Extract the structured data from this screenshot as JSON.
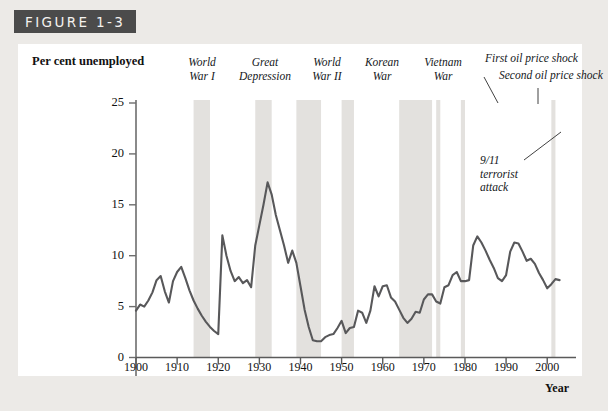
{
  "figure": {
    "banner_label": "FIGURE 1-3"
  },
  "chart_data": {
    "type": "line",
    "title": "",
    "xlabel": "Year",
    "ylabel": "Per cent unemployed",
    "xlim": [
      1900,
      2007
    ],
    "ylim": [
      0,
      27
    ],
    "yticks": [
      "0",
      "5",
      "10",
      "15",
      "20",
      "25"
    ],
    "ytick_values": [
      0,
      5,
      10,
      15,
      20,
      25
    ],
    "xticks": [
      "1900",
      "1910",
      "1920",
      "1930",
      "1940",
      "1950",
      "1960",
      "1970",
      "1980",
      "1990",
      "2000"
    ],
    "xtick_values": [
      1900,
      1910,
      1920,
      1930,
      1940,
      1950,
      1960,
      1970,
      1980,
      1990,
      2000
    ],
    "grid": false,
    "legend": "none",
    "series_name": "Per cent unemployed",
    "line_color": "#58585a",
    "band_color": "#e3e1de",
    "x": [
      1900,
      1901,
      1902,
      1903,
      1904,
      1905,
      1906,
      1907,
      1908,
      1909,
      1910,
      1911,
      1912,
      1913,
      1914,
      1915,
      1916,
      1917,
      1918,
      1919,
      1920,
      1921,
      1922,
      1923,
      1924,
      1925,
      1926,
      1927,
      1928,
      1929,
      1930,
      1931,
      1932,
      1933,
      1934,
      1935,
      1936,
      1937,
      1938,
      1939,
      1940,
      1941,
      1942,
      1943,
      1944,
      1945,
      1946,
      1947,
      1948,
      1949,
      1950,
      1951,
      1952,
      1953,
      1954,
      1955,
      1956,
      1957,
      1958,
      1959,
      1960,
      1961,
      1962,
      1963,
      1964,
      1965,
      1966,
      1967,
      1968,
      1969,
      1970,
      1971,
      1972,
      1973,
      1974,
      1975,
      1976,
      1977,
      1978,
      1979,
      1980,
      1981,
      1982,
      1983,
      1984,
      1985,
      1986,
      1987,
      1988,
      1989,
      1990,
      1991,
      1992,
      1993,
      1994,
      1995,
      1996,
      1997,
      1998,
      1999,
      2000,
      2001,
      2002,
      2003
    ],
    "y": [
      4.6,
      5.2,
      5.0,
      5.6,
      6.4,
      7.6,
      8.0,
      6.5,
      5.4,
      7.5,
      8.4,
      8.9,
      7.8,
      6.6,
      5.6,
      4.8,
      4.1,
      3.5,
      3.0,
      2.6,
      2.3,
      12.0,
      10.0,
      8.5,
      7.5,
      7.9,
      7.3,
      7.6,
      6.9,
      11.0,
      13.0,
      15.0,
      17.2,
      16.0,
      14.0,
      12.5,
      11.0,
      9.3,
      10.5,
      9.3,
      7.0,
      4.7,
      3.0,
      1.7,
      1.6,
      1.6,
      2.0,
      2.2,
      2.3,
      2.9,
      3.6,
      2.4,
      2.9,
      3.0,
      4.6,
      4.4,
      3.4,
      4.6,
      7.0,
      6.0,
      7.0,
      7.1,
      5.9,
      5.5,
      4.7,
      3.9,
      3.4,
      3.8,
      4.5,
      4.4,
      5.7,
      6.2,
      6.2,
      5.5,
      5.3,
      6.9,
      7.1,
      8.1,
      8.4,
      7.5,
      7.5,
      7.6,
      11.0,
      11.9,
      11.3,
      10.5,
      9.6,
      8.8,
      7.8,
      7.5,
      8.1,
      10.4,
      11.3,
      11.2,
      10.4,
      9.5,
      9.7,
      9.2,
      8.3,
      7.6,
      6.8,
      7.2,
      7.7,
      7.6
    ],
    "event_bands": [
      {
        "label": "World\nWar I",
        "start": 1914,
        "end": 1918
      },
      {
        "label": "Great\nDepression",
        "start": 1929,
        "end": 1933
      },
      {
        "label": "World\nWar II",
        "start": 1939,
        "end": 1945
      },
      {
        "label": "Korean\nWar",
        "start": 1950,
        "end": 1953
      },
      {
        "label": "Vietnam\nWar",
        "start": 1964,
        "end": 1972
      },
      {
        "label": "First oil price shock",
        "start": 1973,
        "end": 1974
      },
      {
        "label": "Second oil price shock",
        "start": 1979,
        "end": 1980
      },
      {
        "label": "9/11\nterrorist\nattack",
        "start": 2001,
        "end": 2002
      }
    ],
    "annotations": [
      {
        "text": "World\nWar I"
      },
      {
        "text": "Great\nDepression"
      },
      {
        "text": "World\nWar II"
      },
      {
        "text": "Korean\nWar"
      },
      {
        "text": "Vietnam\nWar"
      },
      {
        "text": "First oil price shock"
      },
      {
        "text": "Second oil price shock"
      },
      {
        "text": "9/11\nterrorist\nattack"
      }
    ]
  }
}
